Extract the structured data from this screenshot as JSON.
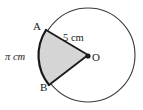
{
  "figure": {
    "shape": "circle-with-sector",
    "colors": {
      "stroke": "#1a1a1a",
      "sector_fill": "#d5d5d5",
      "circle_outline": "#3a3a3a",
      "background": "#ffffff",
      "text": "#1a1a1a"
    },
    "geometry": {
      "center_x": 88,
      "center_y": 55,
      "radius_px": 47,
      "point_a_x": 46,
      "point_a_y": 30,
      "point_b_x": 49,
      "point_b_y": 85
    },
    "labels": {
      "point_a": "A",
      "point_b": "B",
      "center": "O",
      "radius": "5 cm",
      "arc": "π cm"
    }
  }
}
